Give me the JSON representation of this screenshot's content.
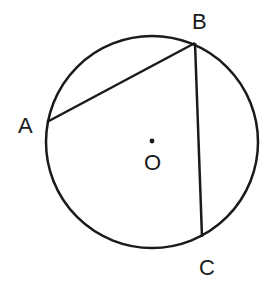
{
  "diagram": {
    "type": "geometry",
    "stroke_color": "#1a1a1a",
    "background": "#ffffff",
    "circle": {
      "center_label": "O",
      "cx": 152,
      "cy": 142,
      "r": 106
    },
    "points": [
      {
        "id": "A",
        "label": "A",
        "x": 47,
        "y": 122,
        "label_x": 18,
        "label_y": 133
      },
      {
        "id": "B",
        "label": "B",
        "x": 195,
        "y": 43,
        "label_x": 192,
        "label_y": 29
      },
      {
        "id": "C",
        "label": "C",
        "x": 202,
        "y": 237,
        "label_x": 199,
        "label_y": 275
      }
    ],
    "center": {
      "label": "O",
      "x": 152,
      "y": 141,
      "label_x": 144,
      "label_y": 170
    },
    "segments": [
      {
        "from": "A",
        "to": "B"
      },
      {
        "from": "B",
        "to": "C"
      }
    ]
  }
}
